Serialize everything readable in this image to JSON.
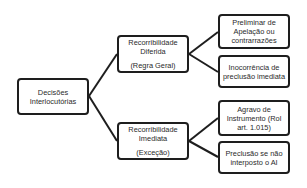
{
  "diagram": {
    "type": "tree",
    "root": {
      "label": "Decisões Interlocutórias"
    },
    "branches": [
      {
        "title_line1": "Recorribilidade",
        "title_line2": "Diferida",
        "subtitle": "(Regra Geral)",
        "children": [
          {
            "label": "Preliminar de Apelação ou contrarrazões"
          },
          {
            "label": "Inocorrência de preclusão imediata"
          }
        ]
      },
      {
        "title_line1": "Recorribilidade",
        "title_line2": "Imediata",
        "subtitle": "(Exceção)",
        "children": [
          {
            "label": "Agravo de Instrumento (Rol art. 1.015)"
          },
          {
            "label": "Preclusão se não interposto o AI"
          }
        ]
      }
    ],
    "colors": {
      "border": "#1e1e1e",
      "text": "#2a2a2a",
      "background": "#ffffff"
    }
  }
}
